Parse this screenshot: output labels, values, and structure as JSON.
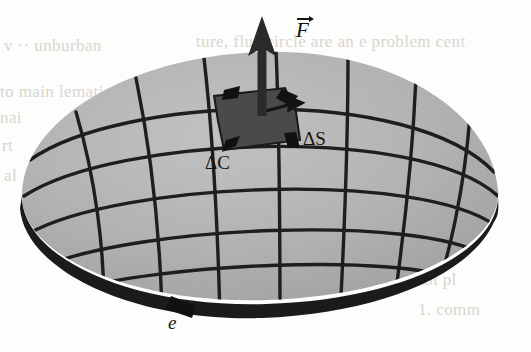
{
  "figure": {
    "caption_absent": true,
    "background_color": "#fdfdfb",
    "surface_fill": "#b2b2b2",
    "patch_fill": "#4a4a4a",
    "ink_color": "#141414",
    "rim_color": "#1a1a1a",
    "bleed_color": "#d8d6d0"
  },
  "labels": {
    "force_vector": "F",
    "delta_c": "ΔC",
    "delta_s": "ΔS",
    "boundary_curve": "e"
  },
  "icons": {
    "normal_vector": "up-arrow-icon",
    "orientation_marker": "arrowhead-icon"
  },
  "bleed_through": {
    "note": "faint reverse-side print showing through the scanned page",
    "lines": [
      {
        "text": "v ·· unburban",
        "x": 4,
        "y": 36
      },
      {
        "text": "ture, fluc circle are an e problem cent",
        "x": 196,
        "y": 32
      },
      {
        "text": "nic",
        "x": 352,
        "y": 62
      },
      {
        "text": "to main lematic",
        "x": 0,
        "y": 82
      },
      {
        "text": "sent re",
        "x": 372,
        "y": 84
      },
      {
        "text": "nai",
        "x": 0,
        "y": 108
      },
      {
        "text": "main",
        "x": 398,
        "y": 110
      },
      {
        "text": "rt",
        "x": 2,
        "y": 136
      },
      {
        "text": "trin",
        "x": 406,
        "y": 140
      },
      {
        "text": "al",
        "x": 4,
        "y": 166
      },
      {
        "text": "it",
        "x": 414,
        "y": 190
      },
      {
        "text": "er",
        "x": 420,
        "y": 218
      },
      {
        "text": "ir to",
        "x": 418,
        "y": 244
      },
      {
        "text": "bl pl",
        "x": 424,
        "y": 270
      },
      {
        "text": "1. comm",
        "x": 418,
        "y": 300
      }
    ]
  },
  "geometry": {
    "type": "parametric-dome-with-grid",
    "description": "A shaded dome-like surface S bounded by an oriented closed curve e, overlaid with a curvilinear grid. One grid cell is darkened as the element of area with its oriented boundary, and a normal force vector rises from its center.",
    "meridian_count": 7,
    "parallel_count": 5
  }
}
